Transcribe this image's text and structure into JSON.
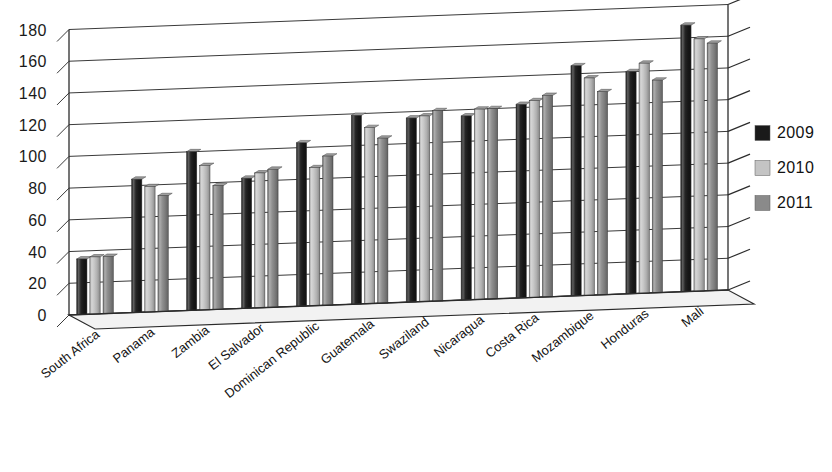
{
  "chart_data": {
    "type": "bar",
    "title": "",
    "subtitle": "",
    "xlabel": "",
    "ylabel": "",
    "ylim": [
      0,
      180
    ],
    "ytick_step": 20,
    "grid": true,
    "legend_position": "right",
    "style": "3d-perspective-grouped-column",
    "categories": [
      "South Africa",
      "Panama",
      "Zambia",
      "El Salvador",
      "Dominican Republic",
      "Guatemala",
      "Swaziland",
      "Nicaragua",
      "Costa Rica",
      "Mozambique",
      "Honduras",
      "Mali"
    ],
    "ytick_labels": [
      "180",
      "160",
      "140",
      "120",
      "100",
      "80",
      "60",
      "40",
      "20",
      "0"
    ],
    "series": [
      {
        "name": "2009",
        "color": "#1a1a1a",
        "values": [
          35,
          84,
          100,
          82,
          103,
          119,
          116,
          116,
          122,
          145,
          140,
          168
        ]
      },
      {
        "name": "2010",
        "color": "#c4c4c4",
        "values": [
          36,
          79,
          91,
          85,
          87,
          111,
          117,
          120,
          124,
          137,
          145,
          159
        ]
      },
      {
        "name": "2011",
        "color": "#8a8a8a",
        "values": [
          36,
          73,
          78,
          87,
          94,
          104,
          120,
          120,
          127,
          128,
          134,
          156
        ]
      }
    ]
  },
  "legend": {
    "items": [
      {
        "label": "2009",
        "color": "#1a1a1a"
      },
      {
        "label": "2010",
        "color": "#c4c4c4"
      },
      {
        "label": "2011",
        "color": "#8a8a8a"
      }
    ]
  }
}
